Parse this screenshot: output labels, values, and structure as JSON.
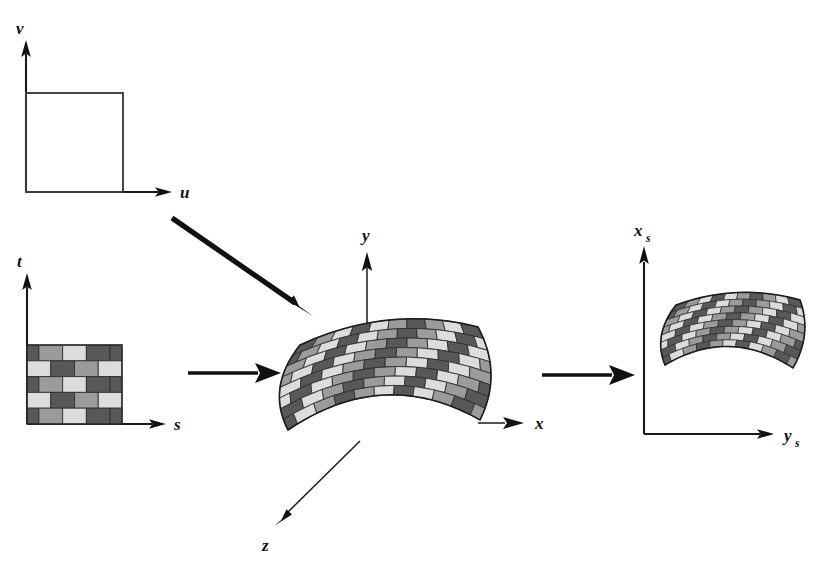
{
  "figure": {
    "background_color": "#ffffff"
  },
  "palette": {
    "brick_dark": "#585858",
    "brick_medium": "#9b9b9b",
    "brick_light": "#dcdcdc",
    "outline": "#2a2a2a",
    "axis": "#111111",
    "square_stroke": "#3d3d3d"
  },
  "panels": [
    {
      "id": "uv-parameter-space",
      "name": "uv-parameter-space",
      "vertical_axis_label": "v",
      "horizontal_axis_label": "u",
      "vertical_axis_sub": "",
      "horizontal_axis_sub": "",
      "content": "empty-unit-square"
    },
    {
      "id": "st-texture-space",
      "name": "st-texture-space",
      "vertical_axis_label": "t",
      "horizontal_axis_label": "s",
      "vertical_axis_sub": "",
      "horizontal_axis_sub": "",
      "content": "brick-texture-square"
    },
    {
      "id": "xyz-object-space",
      "name": "xyz-object-space",
      "vertical_axis_label": "y",
      "horizontal_axis_label": "x",
      "depth_axis_label": "z",
      "content": "curved-brick-surface"
    },
    {
      "id": "screen-space",
      "name": "screen-space",
      "vertical_axis_label": "x",
      "vertical_axis_sub": "s",
      "horizontal_axis_label": "y",
      "horizontal_axis_sub": "s",
      "content": "projected-curved-brick-surface"
    }
  ],
  "arrows": [
    {
      "id": "uv-to-surface",
      "name": "arrow-uv-to-surface",
      "style": "diagonal-thick",
      "from": [
        172,
        218
      ],
      "to": [
        309,
        313
      ]
    },
    {
      "id": "st-to-surface",
      "name": "arrow-st-to-surface",
      "style": "horizontal-thick",
      "from": [
        188,
        373
      ],
      "to": [
        279,
        373
      ]
    },
    {
      "id": "surface-to-screen",
      "name": "arrow-surface-to-screen",
      "style": "horizontal-thick",
      "from": [
        542,
        375
      ],
      "to": [
        633,
        375
      ]
    }
  ],
  "brick_texture": {
    "rows": 5,
    "bricks_per_row": 4,
    "shade_sequence": [
      [
        "dark",
        "medium",
        "light",
        "dark"
      ],
      [
        "light",
        "dark",
        "medium",
        "light"
      ],
      [
        "dark",
        "medium",
        "light",
        "dark"
      ],
      [
        "light",
        "dark",
        "medium",
        "light"
      ],
      [
        "dark",
        "medium",
        "light",
        "dark"
      ]
    ],
    "row_offset_pattern": [
      "half",
      "none",
      "half",
      "none",
      "half"
    ]
  },
  "surface_texture": {
    "rows": 8,
    "columns": 10,
    "shade_cycle": [
      "dark",
      "medium",
      "light",
      "dark",
      "light",
      "medium"
    ],
    "curvature": "convex-bulge-toward-viewer"
  }
}
